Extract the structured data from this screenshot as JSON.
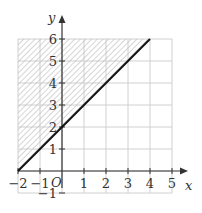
{
  "chart_data": {
    "type": "line",
    "title": "",
    "xlabel": "x",
    "ylabel": "y",
    "origin_label": "O",
    "xlim": [
      -2,
      5
    ],
    "ylim": [
      -1,
      6
    ],
    "grid": true,
    "x_ticks": [
      -2,
      -1,
      1,
      2,
      3,
      4,
      5
    ],
    "x_tick_labels": [
      "−2",
      "−1",
      "1",
      "2",
      "3",
      "4",
      "5"
    ],
    "y_ticks": [
      -1,
      1,
      2,
      3,
      4,
      5,
      6
    ],
    "y_tick_labels": [
      "−1",
      "1",
      "2",
      "3",
      "4",
      "5",
      "6"
    ],
    "series": [
      {
        "name": "y = x + 2",
        "equation": "y = x + 2",
        "x": [
          -2,
          4
        ],
        "y": [
          0,
          6
        ],
        "style": "solid",
        "color": "#111111"
      }
    ],
    "shaded_region": {
      "description": "region above the line y = x + 2, bounded by x = -2, y = 0 and y = 6",
      "inequality": "y >= x + 2",
      "vertices": [
        [
          -2,
          0
        ],
        [
          -2,
          6
        ],
        [
          4,
          6
        ]
      ],
      "pattern": "diagonal hatching",
      "color": "#bbbbbb"
    }
  },
  "colors": {
    "grid": "#d0d0d0",
    "axis": "#333333",
    "line": "#111111",
    "hatch": "#b8b8b8"
  }
}
